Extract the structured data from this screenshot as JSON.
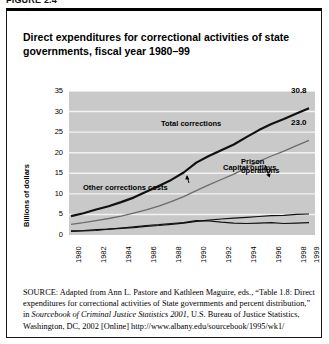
{
  "figure_number": "FIGURE 2.4",
  "title": "Direct expenditures for correctional activities of state governments, fiscal year 1980–99",
  "source": {
    "label": "SOURCE:",
    "text_1": " Adapted from Ann L. Pastore and Kathleen Maguire, eds., “Table 1.8: Direct expenditures for correctional activities of State governments and percent distribution,” in ",
    "italic_1": "Sourcebook of Criminal Justice Statistics 2001",
    "text_2": ", U.S. Bureau of Justice Statistics, Washington, DC, 2002 [Online] http://www.albany.edu/sourcebook/1995/wk1/"
  },
  "chart_data": {
    "type": "line",
    "title": "Direct expenditures for correctional activities of state governments, fiscal year 1980–99",
    "xlabel": "",
    "ylabel": "Billions of dollars",
    "ylim": [
      0,
      35
    ],
    "yticks": [
      35,
      30,
      25,
      20,
      15,
      10,
      5,
      0
    ],
    "grid": true,
    "legend_position": "inline-annotations",
    "categories": [
      "1980",
      "1981",
      "1982",
      "1983",
      "1984",
      "1985",
      "1986",
      "1987",
      "1988",
      "1989",
      "1990",
      "1991",
      "1992",
      "1993",
      "1994",
      "1995",
      "1996",
      "1997",
      "1998",
      "1999"
    ],
    "xtick_labels": [
      "1980",
      "1982",
      "1984",
      "1986",
      "1988",
      "1990",
      "1992",
      "1994",
      "1996",
      "1998",
      "1999"
    ],
    "series": [
      {
        "name": "Total corrections",
        "color": "#111111",
        "width": 2.2,
        "end_label": "30.8",
        "values": [
          4.6,
          5.3,
          6.2,
          7.0,
          8.0,
          9.1,
          10.5,
          11.9,
          13.4,
          15.2,
          17.6,
          19.2,
          20.6,
          22.0,
          23.8,
          25.5,
          27.0,
          28.2,
          29.5,
          30.8
        ]
      },
      {
        "name": "Prison operations",
        "color": "#6b6b6b",
        "width": 1.3,
        "end_label": "23.0",
        "values": [
          2.6,
          3.0,
          3.5,
          4.0,
          4.6,
          5.3,
          6.1,
          7.0,
          8.1,
          9.3,
          10.8,
          12.2,
          13.5,
          14.8,
          16.3,
          17.9,
          19.2,
          20.4,
          21.7,
          23.0
        ]
      },
      {
        "name": "Other corrections costs",
        "color": "#111111",
        "width": 1.2,
        "values": [
          1.0,
          1.1,
          1.3,
          1.4,
          1.6,
          1.8,
          2.1,
          2.3,
          2.6,
          2.9,
          3.3,
          3.6,
          3.9,
          4.1,
          4.3,
          4.5,
          4.7,
          4.8,
          5.0,
          5.1
        ]
      },
      {
        "name": "Capital outlays",
        "color": "#111111",
        "width": 1.2,
        "values": [
          0.9,
          1.0,
          1.1,
          1.4,
          1.7,
          2.0,
          2.3,
          2.5,
          2.8,
          3.0,
          3.5,
          3.4,
          3.1,
          2.9,
          2.8,
          2.9,
          3.0,
          2.8,
          2.9,
          3.0
        ]
      }
    ],
    "annotations": [
      {
        "name": "Total corrections",
        "label": "Total corrections"
      },
      {
        "name": "Prison operations",
        "label": "Prison\noperations"
      },
      {
        "name": "Other corrections costs",
        "label": "Other corrections costs"
      },
      {
        "name": "Capital outlays",
        "label": "Capital outlays"
      }
    ]
  }
}
